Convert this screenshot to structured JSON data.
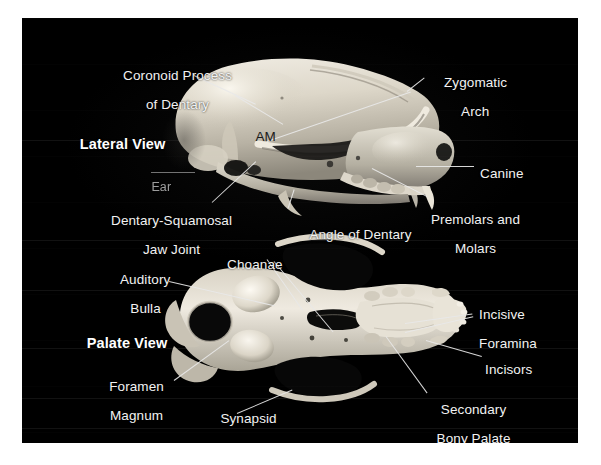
{
  "figure": {
    "background_color": "#000000",
    "border_color": "#ffffff",
    "label_color": "#f2f2f2"
  },
  "views": [
    {
      "id": "lateral",
      "label": "Lateral View"
    },
    {
      "id": "palate",
      "label": "Palate View"
    }
  ],
  "lateral": {
    "view_label": "Lateral View",
    "labels": {
      "coronoid_line1": "Coronoid Process",
      "coronoid_line2": "of Dentary",
      "am": "AM",
      "ear": "Ear",
      "jaw_joint_line1": "Dentary-Squamosal",
      "jaw_joint_line2": "Jaw Joint",
      "angle_of_dentary": "Angle of Dentary",
      "zygomatic_line1": "Zygomatic",
      "zygomatic_line2": "Arch",
      "canine": "Canine",
      "premolars_line1": "Premolars and",
      "premolars_line2": "Molars"
    }
  },
  "palate": {
    "view_label": "Palate View",
    "labels": {
      "choanae": "Choanae",
      "auditory_line1": "Auditory",
      "auditory_line2": "Bulla",
      "foramen_line1": "Foramen",
      "foramen_line2": "Magnum",
      "synapsid_line1": "Synapsid",
      "synapsid_line2": "Opening",
      "incisive_line1": "Incisive",
      "incisive_line2": "Foramina",
      "incisors": "Incisors",
      "secondary_line1": "Secondary",
      "secondary_line2": "Bony Palate"
    }
  }
}
